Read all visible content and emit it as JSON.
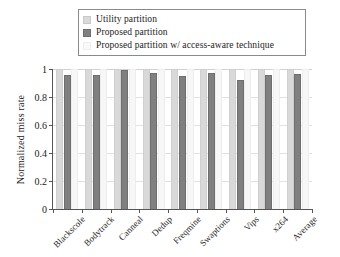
{
  "chart_data": {
    "type": "bar",
    "title": "",
    "subtitle": "",
    "xlabel": "",
    "ylabel": "Normalized miss rate",
    "ylim": [
      0,
      1
    ],
    "yticks": [
      "0",
      "0.2",
      "0.4",
      "0.6",
      "0.8",
      "1"
    ],
    "ytick_values": [
      0,
      0.2,
      0.4,
      0.6,
      0.8,
      1
    ],
    "grid": true,
    "grid_axis": "y",
    "legend_position": "top",
    "orientation": "vertical",
    "grouping": "grouped",
    "categories": [
      "Blackscole",
      "Bodytrack",
      "Canneal",
      "Dedup",
      "Freqmine",
      "Swaptions",
      "Vips",
      "x264",
      "Average"
    ],
    "series": [
      {
        "name": "Utility partition",
        "color": "#d9d9d9",
        "values": [
          1.0,
          1.0,
          1.0,
          1.0,
          1.0,
          1.0,
          1.0,
          1.0,
          1.0
        ]
      },
      {
        "name": "Proposed partition",
        "color": "#808080",
        "values": [
          0.96,
          0.96,
          0.99,
          0.975,
          0.95,
          0.975,
          0.925,
          0.955,
          0.965
        ]
      },
      {
        "name": "Proposed partition w/ access-aware technique",
        "color": "#f7f7f7",
        "values": [
          1.0,
          1.0,
          1.0,
          1.0,
          1.0,
          1.0,
          1.0,
          1.0,
          1.0
        ]
      }
    ]
  },
  "legend": {
    "entries": [
      {
        "label": "Utility partition",
        "color": "#d9d9d9"
      },
      {
        "label": "Proposed partition",
        "color": "#808080"
      },
      {
        "label": "Proposed partition w/ access-aware technique",
        "color": "#f7f7f7"
      }
    ]
  },
  "axes": {
    "y_title": "Normalized miss rate"
  }
}
